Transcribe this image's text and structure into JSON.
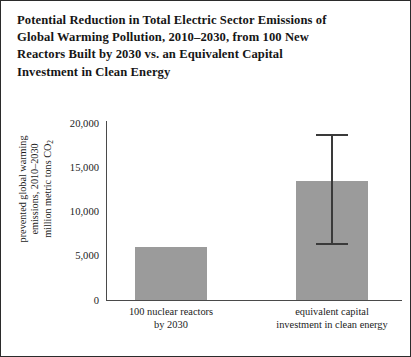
{
  "chart_data": {
    "type": "bar",
    "title": "Potential Reduction in Total Electric Sector Emissions of Global Warming Pollution, 2010–2030, from 100 New Reactors Built by 2030 vs. an Equivalent Capital Investment in Clean Energy",
    "title_lines": [
      "Potential Reduction in Total Electric Sector Emissions of",
      "Global Warming Pollution, 2010–2030, from 100 New",
      "Reactors Built by 2030 vs. an Equivalent Capital",
      "Investment in Clean Energy"
    ],
    "categories": [
      "100 nuclear reactors by 2030",
      "equivalent capital investment in clean energy"
    ],
    "category_label_lines": [
      [
        "100 nuclear reactors",
        "by 2030"
      ],
      [
        "equivalent capital",
        "investment in clean energy"
      ]
    ],
    "values": [
      6000,
      13400
    ],
    "error_bars": [
      null,
      {
        "low": 6300,
        "high": 18600
      }
    ],
    "xlabel": "",
    "ylabel": "prevented global warming emissions, 2010–2030 million metric tons CO2",
    "ylabel_lines": [
      "prevented global warming",
      "emissions, 2010–2030",
      "million metric tons CO"
    ],
    "ylabel_subscript": "2",
    "ylim": [
      0,
      20000
    ],
    "yticks": [
      0,
      5000,
      10000,
      15000,
      20000
    ],
    "ytick_labels": [
      "0",
      "5,000",
      "10,000",
      "15,000",
      "20,000"
    ],
    "grid": false,
    "legend": false,
    "bar_color": "#9b9b9b",
    "axis_color": "#4a4a4a",
    "error_bar_color": "#3a3a3a",
    "frame_color": "#2b2b2b"
  }
}
